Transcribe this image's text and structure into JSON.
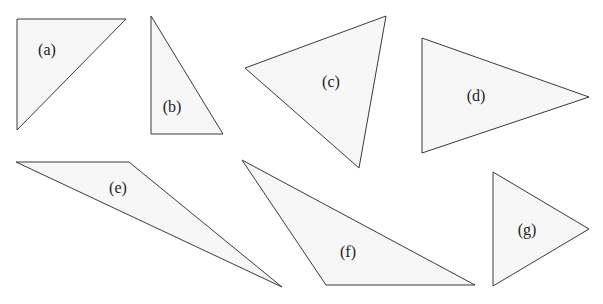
{
  "diagram": {
    "type": "triangle-set",
    "colors": {
      "fill": "#f7f7f7",
      "stroke": "#3a3a3a",
      "label": "#222222"
    },
    "triangles": [
      {
        "id": "a",
        "label": "(a)",
        "points": "17,19 126,19 17,130",
        "label_pos": [
          47,
          50
        ]
      },
      {
        "id": "b",
        "label": "(b)",
        "points": "151,16 151,134 223,134",
        "label_pos": [
          172,
          107
        ]
      },
      {
        "id": "c",
        "label": "(c)",
        "points": "245,68 386,16 359,168",
        "label_pos": [
          331,
          82
        ]
      },
      {
        "id": "d",
        "label": "(d)",
        "points": "422,38 589,97 422,153",
        "label_pos": [
          476,
          96
        ]
      },
      {
        "id": "e",
        "label": "(e)",
        "points": "16,162 129,162 282,287",
        "label_pos": [
          118,
          188
        ]
      },
      {
        "id": "f",
        "label": "(f)",
        "points": "242,160 326,285 475,285",
        "label_pos": [
          348,
          252
        ]
      },
      {
        "id": "g",
        "label": "(g)",
        "points": "493,172 589,229 493,286",
        "label_pos": [
          527,
          230
        ]
      }
    ]
  }
}
